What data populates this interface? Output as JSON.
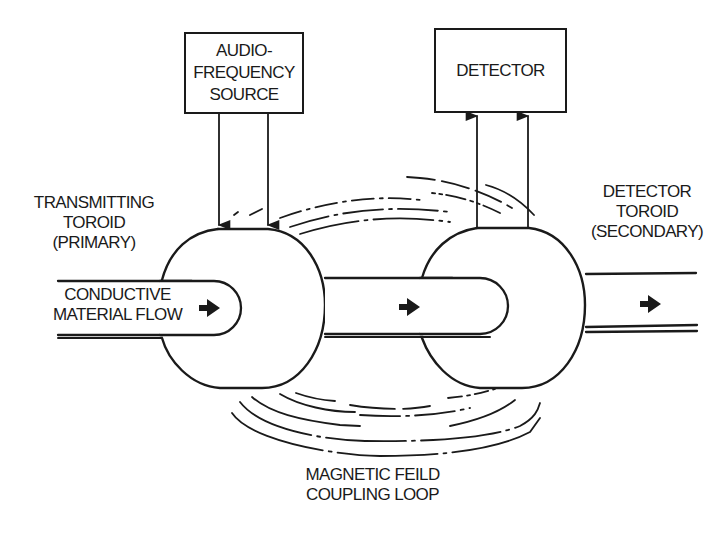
{
  "diagram": {
    "type": "schematic",
    "colors": {
      "line": "#1a1a1a",
      "background": "#ffffff"
    },
    "blocks": {
      "source": {
        "lines": [
          "AUDIO-",
          "FREQUENCY",
          "SOURCE"
        ]
      },
      "detector": {
        "lines": [
          "DETECTOR"
        ]
      }
    },
    "labels": {
      "primary": {
        "lines": [
          "TRANSMITTING",
          "TOROID",
          "(PRIMARY)"
        ]
      },
      "secondary": {
        "lines": [
          "DETECTOR",
          "TOROID",
          "(SECONDARY)"
        ]
      },
      "flow": {
        "lines": [
          "CONDUCTIVE",
          "MATERIAL FLOW"
        ]
      },
      "field": {
        "lines": [
          "MAGNETIC FEILD",
          "COUPLING LOOP"
        ]
      }
    },
    "connections": [
      {
        "from": "source",
        "to": "primary toroid",
        "count": 2,
        "direction": "down"
      },
      {
        "from": "secondary toroid",
        "to": "detector",
        "count": 2,
        "direction": "up"
      }
    ],
    "flow_arrows": [
      "flow-arrow-icon",
      "flow-arrow-icon",
      "flow-arrow-icon"
    ]
  }
}
